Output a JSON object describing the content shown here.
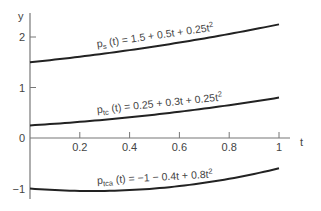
{
  "chart_data": {
    "type": "line",
    "title": "",
    "xlabel": "t",
    "ylabel": "y",
    "xlim": [
      0,
      1
    ],
    "ylim": [
      -1.3,
      2.45
    ],
    "grid": false,
    "x_ticks": [
      0.2,
      0.4,
      0.6,
      0.8,
      1
    ],
    "x_tick_labels": [
      "0.2",
      "0.4",
      "0.6",
      "0.8",
      "1"
    ],
    "y_ticks": [
      2,
      1,
      0,
      -1
    ],
    "y_tick_labels": [
      "2",
      "1",
      "0",
      "−1"
    ],
    "x": [
      0,
      0.1,
      0.2,
      0.3,
      0.4,
      0.5,
      0.6,
      0.7,
      0.8,
      0.9,
      1.0
    ],
    "series": [
      {
        "name": "p_s(t) = 1.5 + 0.5t + 0.25t^2",
        "label_main": "p",
        "label_sub": "s",
        "label_rest": "(t) = 1.5 + 0.5t + 0.25t",
        "label_sup": "2",
        "coefficients": [
          1.5,
          0.5,
          0.25
        ],
        "values": [
          1.5,
          1.5525,
          1.61,
          1.6725,
          1.74,
          1.8125,
          1.89,
          1.9725,
          2.06,
          2.1525,
          2.25
        ]
      },
      {
        "name": "p_tc(t) = 0.25 + 0.3t + 0.25t^2",
        "label_main": "p",
        "label_sub": "tc",
        "label_rest": "(t) = 0.25 + 0.3t + 0.25t",
        "label_sup": "2",
        "coefficients": [
          0.25,
          0.3,
          0.25
        ],
        "values": [
          0.25,
          0.2825,
          0.32,
          0.3625,
          0.41,
          0.4625,
          0.52,
          0.5825,
          0.65,
          0.7225,
          0.8
        ]
      },
      {
        "name": "p_tca(t) = -1 - 0.4t + 0.8t^2",
        "label_main": "p",
        "label_sub": "tca",
        "label_rest": "(t) = −1 − 0.4t + 0.8t",
        "label_sup": "2",
        "coefficients": [
          -1,
          -0.4,
          0.8
        ],
        "values": [
          -1,
          -1.032,
          -1.048,
          -1.048,
          -1.032,
          -1.0,
          -0.952,
          -0.888,
          -0.808,
          -0.712,
          -0.6
        ]
      }
    ]
  },
  "axes": {
    "x_label": "t",
    "y_label": "y"
  }
}
